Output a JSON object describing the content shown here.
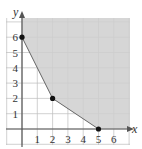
{
  "chart_data": {
    "type": "area",
    "title": "",
    "xlabel": "x",
    "ylabel": "y",
    "xlim": [
      0,
      7
    ],
    "ylim": [
      0,
      7
    ],
    "grid": true,
    "x_ticks": [
      "1",
      "2",
      "3",
      "4",
      "5",
      "6"
    ],
    "y_ticks": [
      "1",
      "2",
      "3",
      "4",
      "5",
      "6"
    ],
    "vertices": [
      {
        "x": 0,
        "y": 6
      },
      {
        "x": 2,
        "y": 2
      },
      {
        "x": 5,
        "y": 0
      }
    ],
    "shaded_region": "unbounded feasible region above/right of boundary polyline (0,6)-(2,2)-(5,0)",
    "colors": {
      "shade": "#cfcfcf",
      "grid": "#bdbdbd",
      "axis": "#555555",
      "point": "#111111"
    }
  }
}
